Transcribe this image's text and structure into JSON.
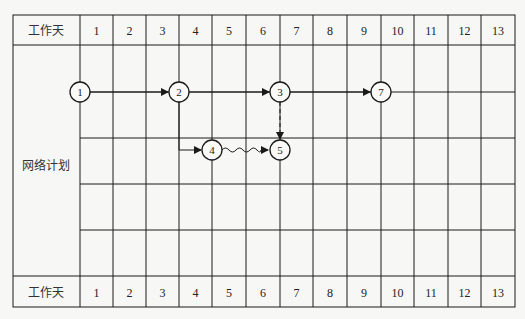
{
  "header": {
    "row_label": "工作天",
    "days": [
      "1",
      "2",
      "3",
      "4",
      "5",
      "6",
      "7",
      "8",
      "9",
      "10",
      "11",
      "12",
      "13"
    ]
  },
  "body": {
    "row_label": "网络计划"
  },
  "footer": {
    "row_label": "工作天",
    "days": [
      "1",
      "2",
      "3",
      "4",
      "5",
      "6",
      "7",
      "8",
      "9",
      "10",
      "11",
      "12",
      "13"
    ]
  },
  "network": {
    "nodes": [
      {
        "id": "1",
        "label": "1",
        "x": 80,
        "y": 92
      },
      {
        "id": "2",
        "label": "2",
        "x": 179,
        "y": 92
      },
      {
        "id": "3",
        "label": "3",
        "x": 280,
        "y": 92
      },
      {
        "id": "7",
        "label": "7",
        "x": 381,
        "y": 92
      },
      {
        "id": "4",
        "label": "4",
        "x": 212,
        "y": 150
      },
      {
        "id": "5",
        "label": "5",
        "x": 280,
        "y": 150
      }
    ],
    "arrows": [
      {
        "from": "1",
        "to": "2",
        "type": "solid"
      },
      {
        "from": "2",
        "to": "3",
        "type": "solid"
      },
      {
        "from": "3",
        "to": "7",
        "type": "solid"
      },
      {
        "from": "2",
        "to": "4",
        "type": "solid-elbow"
      },
      {
        "from": "4",
        "to": "5",
        "type": "wavy"
      },
      {
        "from": "3",
        "to": "5",
        "type": "dashed"
      }
    ]
  },
  "colors": {
    "line": "#1a1a1a",
    "background": "#f7f7f5"
  }
}
